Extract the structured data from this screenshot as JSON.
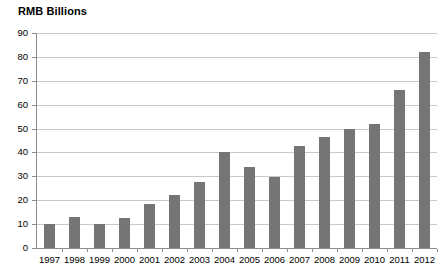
{
  "chart_data": {
    "type": "bar",
    "title": "RMB Billions",
    "xlabel": "",
    "ylabel": "",
    "ylim": [
      0,
      90
    ],
    "ytick_step": 10,
    "yticks": [
      0,
      10,
      20,
      30,
      40,
      50,
      60,
      70,
      80,
      90
    ],
    "grid": true,
    "legend": null,
    "bar_color": "#757575",
    "gridline_color": "#c8c8c8",
    "axis_color": "#8c8c8c",
    "categories": [
      "1997",
      "1998",
      "1999",
      "2000",
      "2001",
      "2002",
      "2003",
      "2004",
      "2005",
      "2006",
      "2007",
      "2008",
      "2009",
      "2010",
      "2011",
      "2012"
    ],
    "values": [
      10.2,
      13.0,
      10.2,
      12.6,
      18.6,
      22.3,
      27.6,
      40.2,
      34.0,
      29.6,
      42.7,
      46.5,
      50.0,
      52.0,
      66.3,
      82.0
    ]
  }
}
